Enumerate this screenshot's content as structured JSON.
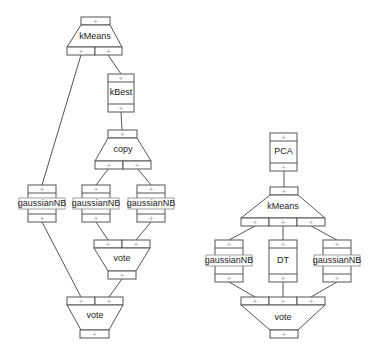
{
  "diagram": {
    "left_pipeline": {
      "nodes": [
        {
          "id": "kmeans1",
          "label": "kMeans",
          "shape": "trapezoid-splitter",
          "outputs": 2
        },
        {
          "id": "kbest",
          "label": "kBest",
          "shape": "box"
        },
        {
          "id": "copy",
          "label": "copy",
          "shape": "trapezoid-splitter",
          "outputs": 2
        },
        {
          "id": "gnb_left",
          "label": "gaussianNB",
          "shape": "box"
        },
        {
          "id": "gnb_mid",
          "label": "gaussianNB",
          "shape": "box"
        },
        {
          "id": "gnb_right",
          "label": "gaussianNB",
          "shape": "box"
        },
        {
          "id": "vote_inner",
          "label": "vote",
          "shape": "trapezoid-merger",
          "inputs": 2
        },
        {
          "id": "vote_outer",
          "label": "vote",
          "shape": "trapezoid-merger",
          "inputs": 2
        }
      ],
      "edges": [
        [
          "kmeans1.out0",
          "gnb_left"
        ],
        [
          "kmeans1.out1",
          "kbest"
        ],
        [
          "kbest",
          "copy"
        ],
        [
          "copy.out0",
          "gnb_mid"
        ],
        [
          "copy.out1",
          "gnb_right"
        ],
        [
          "gnb_mid",
          "vote_inner.in0"
        ],
        [
          "gnb_right",
          "vote_inner.in1"
        ],
        [
          "gnb_left",
          "vote_outer.in0"
        ],
        [
          "vote_inner",
          "vote_outer.in1"
        ]
      ]
    },
    "right_pipeline": {
      "nodes": [
        {
          "id": "pca",
          "label": "PCA",
          "shape": "box"
        },
        {
          "id": "kmeans2",
          "label": "kMeans",
          "shape": "trapezoid-splitter",
          "outputs": 3
        },
        {
          "id": "gnb_a",
          "label": "gaussianNB",
          "shape": "box"
        },
        {
          "id": "dt",
          "label": "DT",
          "shape": "box"
        },
        {
          "id": "gnb_b",
          "label": "gaussianNB",
          "shape": "box"
        },
        {
          "id": "vote_r",
          "label": "vote",
          "shape": "trapezoid-merger",
          "inputs": 3
        }
      ],
      "edges": [
        [
          "pca",
          "kmeans2"
        ],
        [
          "kmeans2.out0",
          "gnb_a"
        ],
        [
          "kmeans2.out1",
          "dt"
        ],
        [
          "kmeans2.out2",
          "gnb_b"
        ],
        [
          "gnb_a",
          "vote_r.in0"
        ],
        [
          "dt",
          "vote_r.in1"
        ],
        [
          "gnb_b",
          "vote_r.in2"
        ]
      ]
    },
    "labels": {
      "kmeans1": "kMeans",
      "kbest": "kBest",
      "copy": "copy",
      "gnb_left": "gaussianNB",
      "gnb_mid": "gaussianNB",
      "gnb_right": "gaussianNB",
      "vote_inner": "vote",
      "vote_outer": "vote",
      "pca": "PCA",
      "kmeans2": "kMeans",
      "gnb_a": "gaussianNB",
      "dt": "DT",
      "gnb_b": "gaussianNB",
      "vote_r": "vote"
    },
    "port_glyph": "+"
  }
}
